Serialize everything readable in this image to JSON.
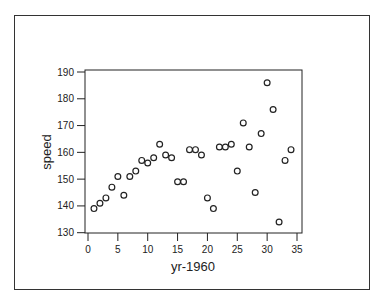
{
  "chart_data": {
    "type": "scatter",
    "title": "",
    "xlabel": "yr-1960",
    "ylabel": "speed",
    "xlim": [
      0,
      35
    ],
    "ylim": [
      130,
      190
    ],
    "xticks": [
      0,
      5,
      10,
      15,
      20,
      25,
      30,
      35
    ],
    "yticks": [
      130,
      140,
      150,
      160,
      170,
      180,
      190
    ],
    "grid": false,
    "legend": null,
    "marker": "open-circle",
    "series": [
      {
        "name": "speed",
        "x": [
          1,
          2,
          3,
          4,
          5,
          6,
          7,
          8,
          9,
          10,
          11,
          12,
          13,
          14,
          15,
          16,
          17,
          18,
          19,
          20,
          21,
          22,
          23,
          24,
          25,
          26,
          27,
          28,
          29,
          30,
          31,
          32,
          33,
          34
        ],
        "y": [
          139,
          141,
          143,
          147,
          151,
          144,
          151,
          153,
          157,
          156,
          158,
          163,
          159,
          158,
          149,
          149,
          161,
          161,
          159,
          143,
          139,
          162,
          162,
          163,
          153,
          171,
          162,
          145,
          167,
          186,
          176,
          134,
          157,
          161
        ]
      }
    ]
  },
  "colors": {
    "marker_stroke": "#222222",
    "axis": "#222222",
    "background": "#ffffff"
  }
}
